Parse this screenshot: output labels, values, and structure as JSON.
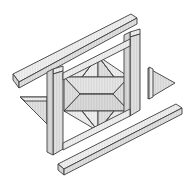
{
  "figure": {
    "type": "technical-line-drawing",
    "canvas": {
      "width": 188,
      "height": 183
    },
    "colors": {
      "background": "#ffffff",
      "face_light": "#eeeeee",
      "face_mid": "#e3e3e3",
      "face_dark": "#d6d6d6",
      "face_darker": "#cccccc",
      "outline": "#3c3c3c",
      "hatch": "#9a9a9a"
    },
    "parts": [
      {
        "id": "top-left-bar",
        "name": "Upper diagonal bar",
        "kind": "parallelogram-slab",
        "orientation": "diagonal-up-right",
        "face_top": "13,74 131,14 137,18 19,82",
        "face_front": "13,74 19,82 19,88 13,80",
        "face_side": "19,82 137,18 137,24 19,88",
        "shade_top": "#eeeeee",
        "shade_front": "#cccccc",
        "shade_side": "#dcdcdc"
      },
      {
        "id": "right-vertical-bar",
        "name": "Right upright slab",
        "kind": "parallelogram-slab",
        "orientation": "vertical-slanted",
        "face_top": "129,34 140,31 140,36 129,40",
        "face_front": "129,40 140,36 140,112 129,116",
        "face_side": "124,37 129,34 129,116 124,113",
        "shade_top": "#f0f0f0",
        "shade_front": "#d8d8d8",
        "shade_side": "#e6e6e6"
      },
      {
        "id": "left-vertical-bar",
        "name": "Left upright slab",
        "kind": "parallelogram-slab",
        "orientation": "vertical-slanted",
        "face_top": "52,70 62,67 62,72 52,76",
        "face_front": "52,76 62,72 62,150 52,155",
        "face_side": "47,73 52,70 52,155 47,152",
        "shade_top": "#f0f0f0",
        "shade_front": "#d8d8d8",
        "shade_side": "#e6e6e6"
      },
      {
        "id": "bottom-bar",
        "name": "Lower diagonal bar",
        "kind": "parallelogram-slab",
        "orientation": "diagonal-up-right",
        "face_top": "58,164 176,104 182,108 64,169",
        "face_front": "58,164 64,169 64,175 58,170",
        "face_side": "64,169 182,108 182,114 64,175",
        "shade_top": "#eeeeee",
        "shade_front": "#cccccc",
        "shade_side": "#dcdcdc"
      },
      {
        "id": "left-triangle",
        "name": "Left corner triangle wing",
        "kind": "triangle-slab",
        "points": "20,97 47,97 47,124",
        "shade": "#e2e2e2"
      },
      {
        "id": "right-triangle",
        "name": "Right corner triangle wing",
        "kind": "triangle-slab",
        "points": "148,68 175,83 148,99",
        "shade": "#e2e2e2"
      },
      {
        "id": "star-core",
        "name": "Central star / octahedron body",
        "kind": "star-polyhedron",
        "apex_top": "98,57",
        "apex_bottom": "98,130",
        "hex_upper_left": "64,77",
        "hex_upper_right": "129,77",
        "hex_mid_left": "64,93",
        "hex_mid_right": "129,93",
        "hex_lower_left": "64,110",
        "hex_lower_right": "129,110",
        "waist_left": "80,93",
        "waist_right": "113,93",
        "shade_upper": "#e4e4e4",
        "shade_lower": "#dadada",
        "shade_spike": "#ececec"
      }
    ],
    "stroke": {
      "outline_width": 0.9,
      "hatch_width": 0.35
    }
  }
}
